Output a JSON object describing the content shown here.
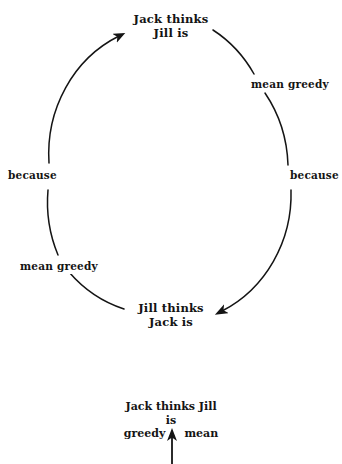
{
  "diagram": {
    "background_color": "#ffffff",
    "ink_color": "#141414",
    "nodes": [
      {
        "id": "top",
        "line1": "Jack thinks",
        "line2": "Jill is"
      },
      {
        "id": "bottom",
        "line1": "Jill thinks",
        "line2": "Jack is"
      }
    ],
    "edge_labels": {
      "upper_right": "mean greedy",
      "right": "because",
      "lower_left": "mean greedy",
      "left": "because"
    },
    "arrows": [
      {
        "id": "to-top",
        "points_to": "Jack thinks Jill is",
        "direction": "up-right"
      },
      {
        "id": "to-bottom",
        "points_to": "Jill thinks Jack is",
        "direction": "left"
      }
    ]
  },
  "caption": {
    "line1": "Jack thinks Jill",
    "line2": "is",
    "left_word": "greedy",
    "right_word": "mean",
    "arrow": "up-arrow"
  }
}
